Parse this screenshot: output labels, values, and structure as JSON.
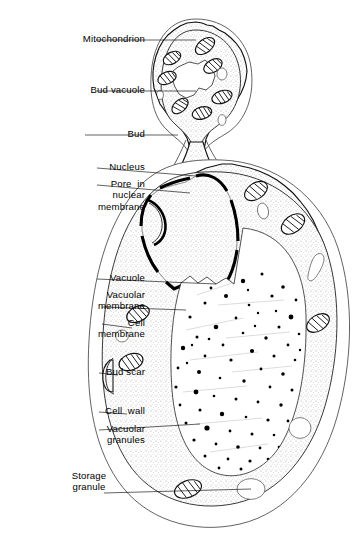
{
  "figure": {
    "background_color": "#ffffff",
    "ink_color": "#000000",
    "cytoplasm_fill": "#f0f0f0"
  },
  "labels": [
    {
      "id": "mitochondrion",
      "text": "Mitochondrion",
      "lines": [
        "Mitochondrion"
      ],
      "align": "right",
      "x": 14,
      "y": 33,
      "leader": {
        "x1": 96,
        "y1": 40,
        "x2": 196,
        "y2": 40
      }
    },
    {
      "id": "bud-vacuole",
      "text": "Bud vacuole",
      "lines": [
        "Bud vacuole"
      ],
      "align": "right",
      "x": 25,
      "y": 84,
      "leader": {
        "x1": 97,
        "y1": 91,
        "x2": 196,
        "y2": 91
      }
    },
    {
      "id": "bud",
      "text": "Bud",
      "lines": [
        "Bud"
      ],
      "align": "right",
      "x": 58,
      "y": 128,
      "leader": {
        "x1": 85,
        "y1": 135,
        "x2": 178,
        "y2": 135
      }
    },
    {
      "id": "nucleus",
      "text": "Nucleus",
      "lines": [
        "Nucleus"
      ],
      "align": "right",
      "x": 44,
      "y": 161,
      "leader": {
        "x1": 97,
        "y1": 168,
        "x2": 196,
        "y2": 176
      }
    },
    {
      "id": "nuclear-pore",
      "text": "Pore in nuclear membrane",
      "lines": [
        "Pore  in",
        "nuclear",
        "membrane"
      ],
      "align": "right",
      "x": 40,
      "y": 178,
      "leader": {
        "x1": 97,
        "y1": 185,
        "x2": 190,
        "y2": 193
      }
    },
    {
      "id": "vacuole",
      "text": "Vacuole",
      "lines": [
        "Vacuole"
      ],
      "align": "right",
      "x": 46,
      "y": 272,
      "leader": {
        "x1": 97,
        "y1": 279,
        "x2": 216,
        "y2": 284
      }
    },
    {
      "id": "vacuolar-membrane",
      "text": "Vacuolar membrane",
      "lines": [
        "Vacuolar",
        "membrane"
      ],
      "align": "right",
      "x": 35,
      "y": 289,
      "leader": {
        "x1": 102,
        "y1": 307,
        "x2": 186,
        "y2": 310
      }
    },
    {
      "id": "cell-membrane",
      "text": "Cell membrane",
      "lines": [
        "Cell",
        "membrane"
      ],
      "align": "right",
      "x": 55,
      "y": 317,
      "leader": {
        "x1": 102,
        "y1": 324,
        "x2": 132,
        "y2": 328
      }
    },
    {
      "id": "bud-scar",
      "text": "Bud scar",
      "lines": [
        "Bud scar"
      ],
      "align": "right",
      "x": 41,
      "y": 366,
      "leader": {
        "x1": 99,
        "y1": 373,
        "x2": 118,
        "y2": 375
      }
    },
    {
      "id": "cell-wall",
      "text": "Cell wall",
      "lines": [
        "Cell  wall"
      ],
      "align": "right",
      "x": 41,
      "y": 405,
      "leader": {
        "x1": 99,
        "y1": 412,
        "x2": 127,
        "y2": 414
      }
    },
    {
      "id": "vacuolar-granules",
      "text": "Vacuolar granules",
      "lines": [
        "Vacuolar",
        "granules"
      ],
      "align": "right",
      "x": 33,
      "y": 423,
      "leader": {
        "x1": 99,
        "y1": 430,
        "x2": 200,
        "y2": 424
      }
    },
    {
      "id": "storage-granule",
      "text": "Storage granule",
      "lines": [
        "Storage",
        "granule"
      ],
      "align": "center",
      "x": 37,
      "y": 470,
      "leader": {
        "x1": 104,
        "y1": 493,
        "x2": 251,
        "y2": 489
      }
    }
  ],
  "structures": {
    "bud": {
      "name": "bud",
      "mitochondria_count": 7,
      "vacuole": "bud vacuole",
      "vesicles": 3
    },
    "mother_cell": {
      "name": "mother cell",
      "mitochondria_count": 6,
      "vesicles": 4,
      "storage_granule": 1,
      "bud_scar": 1
    },
    "nucleus": {
      "name": "nucleus",
      "membrane": "double membrane with pores",
      "pores": 6
    },
    "vacuole": {
      "name": "central vacuole",
      "granules": 72
    }
  }
}
